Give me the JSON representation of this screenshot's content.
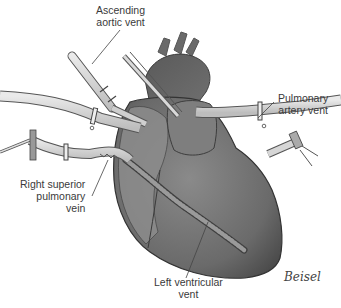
{
  "figure": {
    "labels": {
      "ascending_aortic_vent": [
        "Ascending",
        "aortic vent"
      ],
      "pulmonary_artery_vent": [
        "Pulmonary",
        "artery vent"
      ],
      "right_superior_pulmonary_vein": [
        "Right superior",
        "pulmonary",
        "vein"
      ],
      "left_ventricular_vent": [
        "Left ventricular",
        "vent"
      ]
    },
    "signature": "Beisel"
  },
  "colors": {
    "heart_dark": "#5a5a5a",
    "heart_mid": "#7d7d7d",
    "heart_light": "#9a9a9a",
    "tube_fill": "#d4d4d4",
    "tube_stroke": "#555555",
    "text": "#3a3a3a"
  }
}
